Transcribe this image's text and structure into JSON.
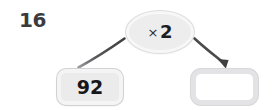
{
  "worksheet": {
    "problem_number": "16",
    "type": "function-machine",
    "rule": {
      "operator_symbol": "×",
      "operator_name": "multiply",
      "operand": "2",
      "full_label": "× 2"
    },
    "input_box": {
      "value": "92",
      "filled": true
    },
    "output_box": {
      "value": "",
      "placeholder": "",
      "filled": false
    },
    "connectors": [
      {
        "name": "input-to-rule",
        "from": "input-box",
        "to": "rule-oval",
        "arrowhead": false
      },
      {
        "name": "rule-to-output",
        "from": "rule-oval",
        "to": "output-box",
        "arrowhead": true
      }
    ],
    "colors": {
      "canvas": "#ffffff",
      "number_text": "#3b3b3d",
      "value_text": "#17171a",
      "oval_fill": "#ededee",
      "oval_ring": "#f7f7f8",
      "input_box_fill": "#ebebec",
      "output_box_fill": "#ffffff",
      "box_border": "#e3e3e5",
      "connector_line": "#4b4b4e"
    }
  }
}
